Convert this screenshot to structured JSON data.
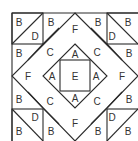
{
  "diagram": {
    "type": "quilt-block-layout",
    "stroke_color": "#2b2b2b",
    "label_color": "#333333",
    "labels": [
      {
        "id": "tl-corner-B",
        "text": "B",
        "x": 19,
        "y": 22
      },
      {
        "id": "tl-corner-D",
        "text": "D",
        "x": 35,
        "y": 36
      },
      {
        "id": "top-B-left",
        "text": "B",
        "x": 51,
        "y": 22
      },
      {
        "id": "top-F",
        "text": "F",
        "x": 75,
        "y": 29
      },
      {
        "id": "top-B-right",
        "text": "B",
        "x": 98,
        "y": 22
      },
      {
        "id": "tr-corner-D",
        "text": "D",
        "x": 112,
        "y": 36
      },
      {
        "id": "tr-corner-B",
        "text": "B",
        "x": 128,
        "y": 22
      },
      {
        "id": "left-B-top",
        "text": "B",
        "x": 19,
        "y": 53
      },
      {
        "id": "C-top-left",
        "text": "C",
        "x": 50,
        "y": 52
      },
      {
        "id": "A-top",
        "text": "A",
        "x": 75,
        "y": 54
      },
      {
        "id": "C-top-right",
        "text": "C",
        "x": 97,
        "y": 52
      },
      {
        "id": "right-B-top",
        "text": "B",
        "x": 129,
        "y": 53
      },
      {
        "id": "left-F",
        "text": "F",
        "x": 28,
        "y": 76
      },
      {
        "id": "A-left",
        "text": "A",
        "x": 52,
        "y": 76
      },
      {
        "id": "center-E",
        "text": "E",
        "x": 75,
        "y": 76
      },
      {
        "id": "A-right",
        "text": "A",
        "x": 96,
        "y": 76
      },
      {
        "id": "right-F",
        "text": "F",
        "x": 122,
        "y": 76
      },
      {
        "id": "left-B-bottom",
        "text": "B",
        "x": 19,
        "y": 99
      },
      {
        "id": "C-bottom-left",
        "text": "C",
        "x": 50,
        "y": 101
      },
      {
        "id": "A-bottom",
        "text": "A",
        "x": 75,
        "y": 98
      },
      {
        "id": "C-bottom-right",
        "text": "C",
        "x": 97,
        "y": 101
      },
      {
        "id": "right-B-bottom",
        "text": "B",
        "x": 129,
        "y": 99
      },
      {
        "id": "bl-corner-D",
        "text": "D",
        "x": 35,
        "y": 117
      },
      {
        "id": "bl-corner-B",
        "text": "B",
        "x": 19,
        "y": 131
      },
      {
        "id": "bottom-B-left",
        "text": "B",
        "x": 51,
        "y": 131
      },
      {
        "id": "bottom-F",
        "text": "F",
        "x": 75,
        "y": 123
      },
      {
        "id": "bottom-B-right",
        "text": "B",
        "x": 98,
        "y": 131
      },
      {
        "id": "br-corner-D",
        "text": "D",
        "x": 112,
        "y": 117
      },
      {
        "id": "br-corner-B",
        "text": "B",
        "x": 128,
        "y": 131
      }
    ]
  }
}
